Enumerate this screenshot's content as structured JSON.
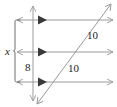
{
  "figure": {
    "name": "parallel-lines-cut-by-transversals",
    "width": 117,
    "height": 107,
    "background_color": "#ffffff",
    "line_color": "#9a9a9a",
    "marker_color": "#3a3a3a",
    "bracket_color": "#6e6e6e",
    "text_color": "#1a1a1a"
  },
  "labels": {
    "x": "x",
    "eight": "8",
    "ten_upper": "10",
    "ten_lower": "10"
  },
  "parallel_lines": [
    {
      "name": "top-parallel-line",
      "y": 20,
      "x_start": 17,
      "x_end": 113
    },
    {
      "name": "middle-parallel-line",
      "y": 52,
      "x_start": 17,
      "x_end": 113
    },
    {
      "name": "bottom-parallel-line",
      "y": 82,
      "x_start": 17,
      "x_end": 113
    }
  ],
  "transversals": [
    {
      "name": "vertical-transversal",
      "x1": 33,
      "y1": 6,
      "x2": 33,
      "y2": 101
    },
    {
      "name": "diagonal-transversal",
      "x1": 37,
      "y1": 104,
      "x2": 111,
      "y2": 4
    }
  ],
  "bracket": {
    "name": "x-measure-bracket",
    "x": 15,
    "y_top": 20,
    "y_bottom": 82,
    "tick_length": 5
  },
  "parallel_marks": {
    "name": "parallel-arrow-marks",
    "x": 43,
    "ys": [
      20,
      52,
      82
    ]
  }
}
